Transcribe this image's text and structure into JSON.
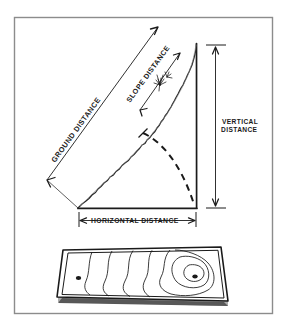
{
  "figure": {
    "style": "hand-drawn pen sketch",
    "frame_color": "#8c8c8c",
    "ink_color": "#1a1a1a",
    "background_color": "#ffffff"
  },
  "labels": {
    "ground_distance": "GROUND DISTANCE",
    "slope_distance": "SLOPE DISTANCE",
    "vertical_distance_line1": "VERTICAL",
    "vertical_distance_line2": "DISTANCE",
    "horizontal_distance": "HORIZONTAL DISTANCE"
  },
  "upper_panel": {
    "name": "slope-triangle",
    "apex": {
      "x": 196,
      "y": 43
    },
    "base_left": {
      "x": 78,
      "y": 208
    },
    "base_right": {
      "x": 196,
      "y": 208
    },
    "terrain_profile": "irregular jagged ground surface from base-left up to apex",
    "dashed_arc": "arc swung from slope line down to base-right corner",
    "vegetation_marker": "small shrub sketch on upper slope"
  },
  "lower_panel": {
    "name": "contour-map-plate",
    "description": "tilted rectangular plate showing contour lines",
    "contour_line_count": 7,
    "markers": [
      {
        "name": "station-point-left",
        "x": 78,
        "y": 278
      },
      {
        "name": "summit-point-right",
        "x": 195,
        "y": 277
      }
    ]
  }
}
